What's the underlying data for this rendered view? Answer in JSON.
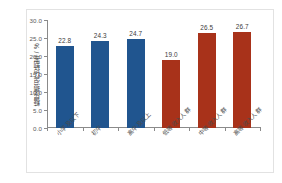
{
  "chart_data": {
    "type": "bar",
    "title": "",
    "xlabel": "",
    "ylabel": "糖尿病治疗控制率 / %",
    "ylim": [
      0.0,
      30.0
    ],
    "ytick_labels": [
      "0.0",
      "5.0",
      "10.0",
      "15.0",
      "20.0",
      "25.0",
      "30.0"
    ],
    "ytick_values": [
      0.0,
      5.0,
      10.0,
      15.0,
      20.0,
      25.0,
      30.0
    ],
    "grid": false,
    "legend": false,
    "categories": [
      "小学及以下",
      "初中",
      "高中及以上",
      "低等收入人群",
      "中等收入人群",
      "高等收入人群"
    ],
    "values": [
      22.8,
      24.3,
      24.7,
      19.0,
      26.5,
      26.7
    ],
    "value_labels": [
      "22.8",
      "24.3",
      "24.7",
      "19.0",
      "26.5",
      "26.7"
    ],
    "bar_colors": [
      "#20558f",
      "#20558f",
      "#20558f",
      "#a8321a",
      "#a8321a",
      "#a8321a"
    ],
    "colors": {
      "blue": "#20558f",
      "red": "#a8321a",
      "axis": "#8a8a8a",
      "text": "#3b3b3b",
      "frame": "#e2e2e2",
      "background": "#ffffff"
    }
  }
}
